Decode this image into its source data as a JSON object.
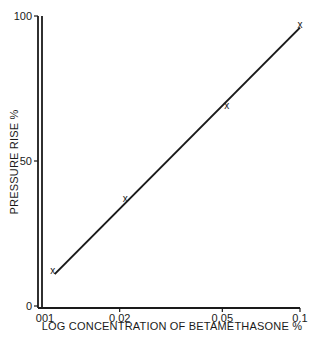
{
  "chart_data": {
    "type": "line",
    "title": "",
    "xlabel": "LOG CONCENTRATION OF BETAMETHASONE %",
    "ylabel": "PRESSURE RISE %",
    "x_scale": "log",
    "xlim": [
      0.01,
      0.1
    ],
    "ylim": [
      0,
      100
    ],
    "x_ticks": [
      {
        "value": 0.01,
        "label": "001"
      },
      {
        "value": 0.02,
        "label": "0.02"
      },
      {
        "value": 0.05,
        "label": "0.05"
      },
      {
        "value": 0.1,
        "label": "0.1"
      }
    ],
    "y_ticks": [
      {
        "value": 0,
        "label": "0"
      },
      {
        "value": 50,
        "label": "50"
      },
      {
        "value": 100,
        "label": "100"
      }
    ],
    "grid": false,
    "legend": null,
    "series": [
      {
        "name": "observed",
        "marker": "x",
        "points": [
          {
            "x": 0.011,
            "y": 12
          },
          {
            "x": 0.021,
            "y": 37
          },
          {
            "x": 0.052,
            "y": 69
          },
          {
            "x": 0.1,
            "y": 97
          }
        ]
      },
      {
        "name": "fitted line",
        "style": "line",
        "points": [
          {
            "x": 0.0112,
            "y": 11
          },
          {
            "x": 0.1,
            "y": 96
          }
        ]
      }
    ],
    "marker_glyph": "x"
  }
}
